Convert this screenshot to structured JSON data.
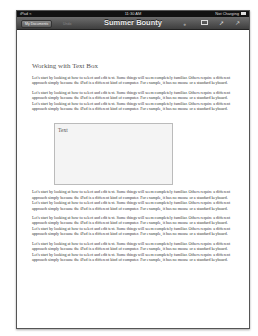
{
  "status_bar": {
    "device": "iPad",
    "wifi_icon": "wifi-icon",
    "time": "11:30 AM",
    "battery_text": "Not Charging",
    "battery_icon": "battery-icon"
  },
  "toolbar": {
    "documents_button": "My Documents",
    "undo_button": "Undo",
    "title": "Summer Bounty",
    "icons": [
      "info-icon",
      "media-icon",
      "wrench-icon",
      "expand-icon"
    ]
  },
  "document": {
    "heading": "Working with Text Box",
    "paragraphs_before": [
      "Let's start by looking at how to select and edit text. Some things will seem completely familiar. Others require a different approach simply because the iPad is a different kind of computer. For example, it has no mouse or a standard keyboard.",
      "Let's start by looking at how to select and edit text. Some things will seem completely familiar. Others require a different approach simply because the iPad is a different kind of computer. For example, it has no mouse or a standard keyboard. Let's start by looking at how to select and edit text. Some things will seem completely familiar. Others require a different approach simply because the iPad is a different kind of computer. For example, it has no mouse or a standard keyboard."
    ],
    "text_box": "Text",
    "paragraphs_after": [
      "Let's start by looking at how to select and edit text. Some things will seem completely familiar. Others require a different approach simply because the iPad is a different kind of computer. For example, it has no mouse or a standard keyboard. Let's start by looking at how to select and edit text. Some things will seem completely familiar. Others require a different approach simply because the iPad is a different kind of computer. For example, it has no mouse or a standard keyboard.",
      "Let's start by looking at how to select and edit text. Some things will seem completely familiar. Others require a different approach simply because the iPad is a different kind of computer. For example, it has no mouse or a standard keyboard. Let's start by looking at how to select and edit text. Some things will seem completely familiar. Others require a different approach simply because the iPad is a different kind of computer. For example, it has no mouse or a standard keyboard.",
      "Let's start by looking at how to select and edit text. Some things will seem completely familiar. Others require a different approach simply because the iPad is a different kind of computer. For example, it has no mouse or a standard keyboard. Let's start by looking at how to select and edit text. Some things will seem completely familiar. Others require a different approach simply because the iPad is a different kind of computer. For example, it has no mouse or a standard keyboard."
    ]
  }
}
